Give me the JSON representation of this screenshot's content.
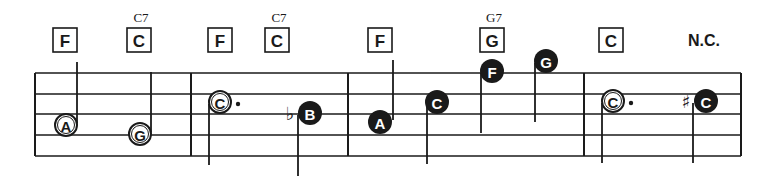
{
  "score": {
    "staff": {
      "left": 35,
      "right": 741,
      "lines_y": [
        73,
        94,
        114,
        135,
        156
      ],
      "bar_lines_x": [
        35,
        191,
        348,
        584,
        741
      ]
    },
    "chords": [
      {
        "label": "F",
        "x": 65,
        "alt": ""
      },
      {
        "label": "C",
        "x": 139,
        "alt": "C7"
      },
      {
        "label": "F",
        "x": 220,
        "alt": ""
      },
      {
        "label": "C",
        "x": 277,
        "alt": "C7"
      },
      {
        "label": "F",
        "x": 380,
        "alt": ""
      },
      {
        "label": "G",
        "x": 492,
        "alt": "G7"
      },
      {
        "label": "C",
        "x": 611,
        "alt": ""
      }
    ],
    "no_chord": {
      "label": "N.C.",
      "x": 704
    },
    "notes": [
      {
        "name": "A",
        "x": 66,
        "y": 125,
        "style": "open",
        "stem": "up",
        "stem_x": 77,
        "stem_end": 62,
        "dotted": false,
        "accidental": ""
      },
      {
        "name": "G",
        "x": 140,
        "y": 134,
        "style": "open",
        "stem": "up",
        "stem_x": 151,
        "stem_end": 72,
        "dotted": false,
        "accidental": ""
      },
      {
        "name": "C",
        "x": 220,
        "y": 102,
        "style": "open",
        "stem": "down",
        "stem_x": 209,
        "stem_end": 165,
        "dotted": true,
        "accidental": ""
      },
      {
        "name": "B",
        "x": 310,
        "y": 113,
        "style": "filled",
        "stem": "down",
        "stem_x": 298,
        "stem_end": 176,
        "dotted": false,
        "accidental": "♭"
      },
      {
        "name": "A",
        "x": 380,
        "y": 122,
        "style": "filled",
        "stem": "up",
        "stem_x": 393,
        "stem_end": 60,
        "dotted": false,
        "accidental": ""
      },
      {
        "name": "C",
        "x": 437,
        "y": 102,
        "style": "filled",
        "stem": "down",
        "stem_x": 427,
        "stem_end": 164,
        "dotted": false,
        "accidental": ""
      },
      {
        "name": "F",
        "x": 492,
        "y": 71,
        "style": "filled",
        "stem": "down",
        "stem_x": 481,
        "stem_end": 133,
        "dotted": false,
        "accidental": ""
      },
      {
        "name": "G",
        "x": 546,
        "y": 61,
        "style": "filled",
        "stem": "down",
        "stem_x": 535,
        "stem_end": 122,
        "dotted": false,
        "accidental": ""
      },
      {
        "name": "C",
        "x": 613,
        "y": 101,
        "style": "open",
        "stem": "down",
        "stem_x": 602,
        "stem_end": 163,
        "dotted": true,
        "accidental": ""
      },
      {
        "name": "C",
        "x": 706,
        "y": 101,
        "style": "filled",
        "stem": "down",
        "stem_x": 693,
        "stem_end": 163,
        "dotted": false,
        "accidental": "♯"
      }
    ]
  }
}
